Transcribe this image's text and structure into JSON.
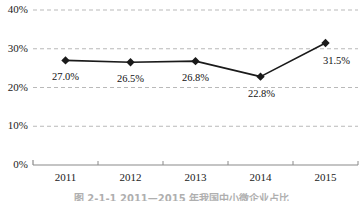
{
  "chart_data": {
    "type": "line",
    "title": "",
    "subtitle": "",
    "xlabel": "",
    "ylabel": "",
    "categories": [
      "2011",
      "2012",
      "2013",
      "2014",
      "2015"
    ],
    "values": [
      27.0,
      26.5,
      26.8,
      22.8,
      31.5
    ],
    "data_labels": [
      "27.0%",
      "26.5%",
      "26.8%",
      "22.8%",
      "31.5%"
    ],
    "series": [
      {
        "name": "",
        "values": [
          27.0,
          26.5,
          26.8,
          22.8,
          31.5
        ]
      }
    ],
    "ylim": [
      0,
      40
    ],
    "y_ticks": [
      0,
      10,
      20,
      30,
      40
    ],
    "y_tick_labels": [
      "0%",
      "10%",
      "20%",
      "30%",
      "40%"
    ],
    "x_tick_labels": [
      "2011",
      "2012",
      "2013",
      "2014",
      "2015"
    ],
    "grid": true,
    "grid_axis": "y",
    "grid_style": "dashed",
    "legend": "none",
    "marker": "diamond",
    "line_color": "#1a1a1a",
    "marker_color": "#1a1a1a",
    "grid_color": "#b9b9b9",
    "axis_color": "#8a8a8a",
    "text_color": "#222222"
  },
  "caption": {
    "text": "图 2-1-1  2011—2015 年我国中小微企业占比"
  }
}
